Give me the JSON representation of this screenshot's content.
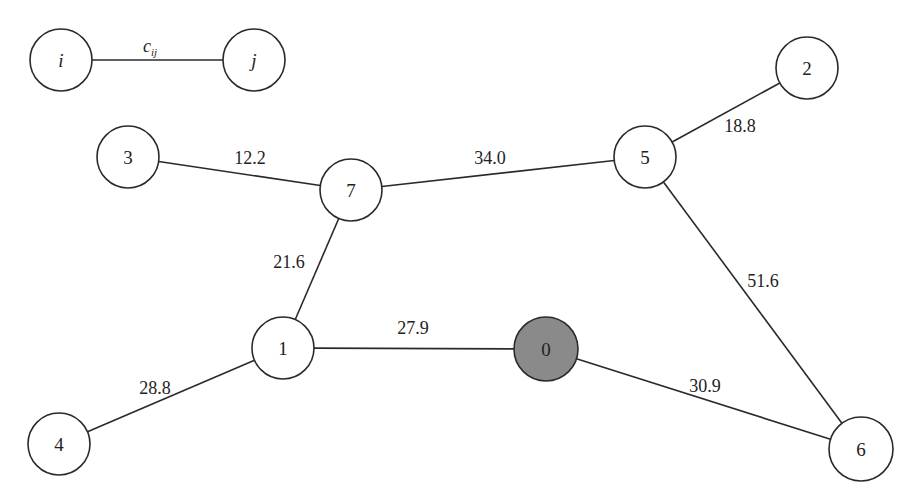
{
  "diagram": {
    "type": "weighted-undirected-graph",
    "colors": {
      "stroke": "#2a2a2a",
      "node_fill": "#ffffff",
      "depot_fill": "#8a8a8a",
      "text": "#222222"
    },
    "legend": {
      "node_i": {
        "label": "i",
        "x": 61,
        "y": 60,
        "r": 31
      },
      "node_j": {
        "label": "j",
        "x": 254,
        "y": 60,
        "r": 31
      },
      "edge_label": "c",
      "edge_label_sub": "ij",
      "edge_label_pos": {
        "x": 150,
        "y": 52
      }
    },
    "nodes": [
      {
        "id": "0",
        "label": "0",
        "x": 546,
        "y": 349,
        "r": 32,
        "depot": true
      },
      {
        "id": "1",
        "label": "1",
        "x": 283,
        "y": 348,
        "r": 31,
        "depot": false
      },
      {
        "id": "2",
        "label": "2",
        "x": 807,
        "y": 68,
        "r": 31,
        "depot": false
      },
      {
        "id": "3",
        "label": "3",
        "x": 128,
        "y": 157,
        "r": 31,
        "depot": false
      },
      {
        "id": "4",
        "label": "4",
        "x": 59,
        "y": 444,
        "r": 31,
        "depot": false
      },
      {
        "id": "5",
        "label": "5",
        "x": 645,
        "y": 157,
        "r": 31,
        "depot": false
      },
      {
        "id": "6",
        "label": "6",
        "x": 861,
        "y": 449,
        "r": 32,
        "depot": false
      },
      {
        "id": "7",
        "label": "7",
        "x": 351,
        "y": 190,
        "r": 31,
        "depot": false
      }
    ],
    "edges": [
      {
        "from": "3",
        "to": "7",
        "weight": "12.2",
        "label_x": 250,
        "label_y": 164
      },
      {
        "from": "7",
        "to": "5",
        "weight": "34.0",
        "label_x": 490,
        "label_y": 164
      },
      {
        "from": "5",
        "to": "2",
        "weight": "18.8",
        "label_x": 740,
        "label_y": 132
      },
      {
        "from": "7",
        "to": "1",
        "weight": "21.6",
        "label_x": 289,
        "label_y": 268
      },
      {
        "from": "5",
        "to": "6",
        "weight": "51.6",
        "label_x": 763,
        "label_y": 287
      },
      {
        "from": "1",
        "to": "0",
        "weight": "27.9",
        "label_x": 413,
        "label_y": 334
      },
      {
        "from": "1",
        "to": "4",
        "weight": "28.8",
        "label_x": 155,
        "label_y": 394
      },
      {
        "from": "0",
        "to": "6",
        "weight": "30.9",
        "label_x": 705,
        "label_y": 392
      }
    ]
  }
}
